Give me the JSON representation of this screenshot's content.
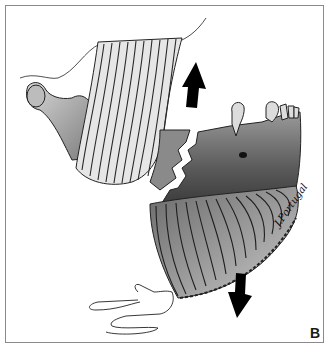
{
  "figure": {
    "panel_label": "B",
    "signature": "J.Portugal",
    "arrows": [
      {
        "name": "upward-pull-arrow",
        "direction": "up"
      },
      {
        "name": "downward-pull-arrow",
        "direction": "down"
      }
    ],
    "colors": {
      "ink": "#111111",
      "shade_dark": "#3a3a3a",
      "shade_mid": "#7a7a7a",
      "shade_light": "#c8c8c8",
      "frame": "#8a8a8a",
      "background": "#ffffff"
    }
  }
}
